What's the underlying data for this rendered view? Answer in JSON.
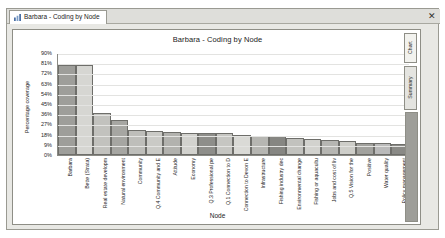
{
  "window": {
    "tab_label": "Barbara - Coding by Node",
    "tab_icon": "bar-chart-icon",
    "close_label": "✕"
  },
  "side_tabs": [
    {
      "label": "Chart"
    },
    {
      "label": "Summary"
    }
  ],
  "chart_data": {
    "type": "bar",
    "title": "Barbara - Coding by Node",
    "xlabel": "Node",
    "ylabel": "Percentage coverage",
    "ylim": [
      0,
      90
    ],
    "ytick_labels": [
      "90%",
      "81%",
      "72%",
      "63%",
      "54%",
      "45%",
      "36%",
      "27%",
      "18%",
      "9%",
      "0%"
    ],
    "ytick_values": [
      90,
      81,
      72,
      63,
      54,
      45,
      36,
      27,
      18,
      9,
      0
    ],
    "grid": true,
    "legend": "none",
    "categories": [
      "Barbara",
      "Bette (Strata)",
      "Real estate developm",
      "Natural environment",
      "Community",
      "Q.4 Community and E",
      "Attitude",
      "Economy",
      "Q.3 Professional pe",
      "Q.1 Connection to D",
      "Connection to Devon E",
      "Infrastructure",
      "Fishing industry dec",
      "Environmental change",
      "Fishing or aquacultu",
      "Jobs and cost of liv",
      "Q.5 Vision for the",
      "Positive",
      "Water quality",
      "Policy management"
    ],
    "values": [
      79,
      79,
      37,
      31,
      22,
      21,
      20,
      19,
      19,
      19,
      18,
      17,
      17,
      15,
      14,
      13,
      12,
      11,
      11,
      10
    ],
    "bar_colors": [
      "#9e9e9a",
      "#d6d6d2",
      "#c2c2be",
      "#a6a6a2",
      "#bebeba",
      "#cacac6",
      "#b2b2ae",
      "#d2d2ce",
      "#8e8e8a",
      "#c6c6c2",
      "#dadad6",
      "#b6b6b2",
      "#868682",
      "#c2c2be",
      "#d2d2ce",
      "#b6b6b2",
      "#cecec9",
      "#a2a29e",
      "#bababa",
      "#8a8a86"
    ]
  }
}
